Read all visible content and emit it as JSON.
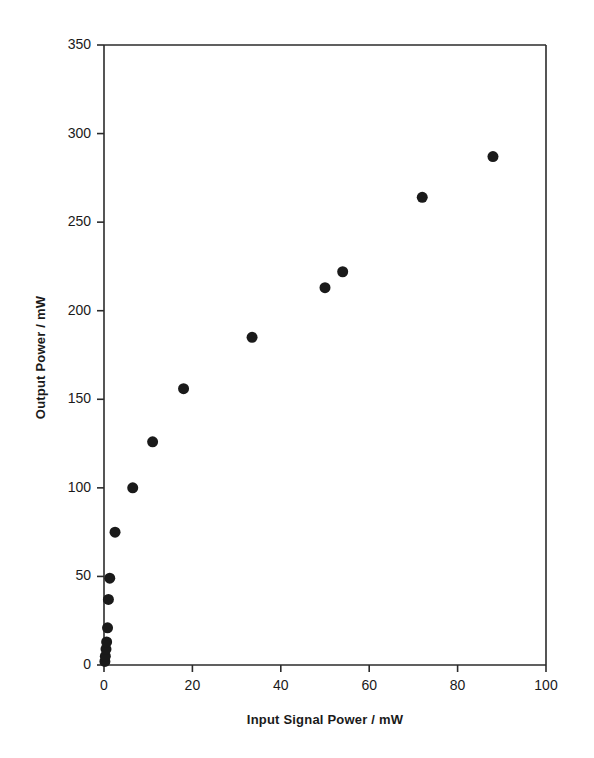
{
  "chart_data": {
    "type": "scatter",
    "title": "",
    "xlabel": "Input Signal Power / mW",
    "ylabel": "Output Power / mW",
    "xlim": [
      0,
      100
    ],
    "ylim": [
      0,
      350
    ],
    "xticks": [
      0,
      20,
      40,
      60,
      80,
      100
    ],
    "yticks": [
      0,
      50,
      100,
      150,
      200,
      250,
      300,
      350
    ],
    "xtick_labels": [
      "0",
      "20",
      "40",
      "60",
      "80",
      "100"
    ],
    "ytick_labels": [
      "0",
      "50",
      "100",
      "150",
      "200",
      "250",
      "300",
      "350"
    ],
    "grid": false,
    "legend": null,
    "marker": {
      "shape": "circle",
      "color": "#1a1a1a",
      "size_px": 11
    },
    "series": [
      {
        "name": "Output Power",
        "x": [
          0.2,
          0.3,
          0.45,
          0.6,
          0.8,
          1.0,
          1.3,
          2.5,
          6.5,
          11.0,
          18.0,
          33.5,
          50.0,
          54.0,
          72.0,
          88.0
        ],
        "y": [
          2,
          5,
          9,
          13,
          21,
          37,
          49,
          75,
          100,
          126,
          156,
          185,
          213,
          222,
          264,
          287
        ]
      }
    ],
    "points": [
      {
        "x": 0.2,
        "y": 2
      },
      {
        "x": 0.3,
        "y": 5
      },
      {
        "x": 0.45,
        "y": 9
      },
      {
        "x": 0.6,
        "y": 13
      },
      {
        "x": 0.8,
        "y": 21
      },
      {
        "x": 1.0,
        "y": 37
      },
      {
        "x": 1.3,
        "y": 49
      },
      {
        "x": 2.5,
        "y": 75
      },
      {
        "x": 6.5,
        "y": 100
      },
      {
        "x": 11.0,
        "y": 126
      },
      {
        "x": 18.0,
        "y": 156
      },
      {
        "x": 33.5,
        "y": 185
      },
      {
        "x": 50.0,
        "y": 213
      },
      {
        "x": 54.0,
        "y": 222
      },
      {
        "x": 72.0,
        "y": 264
      },
      {
        "x": 88.0,
        "y": 287
      }
    ]
  },
  "axes": {
    "x_title": "Input Signal Power / mW",
    "y_title": "Output Power / mW",
    "x_labels": [
      "0",
      "20",
      "40",
      "60",
      "80",
      "100"
    ],
    "y_labels": [
      "350",
      "300",
      "250",
      "200",
      "150",
      "100",
      "50",
      "0"
    ]
  },
  "style": {
    "axis_color": "#2b2b2b",
    "marker_color": "#1a1a1a",
    "background": "#ffffff"
  }
}
